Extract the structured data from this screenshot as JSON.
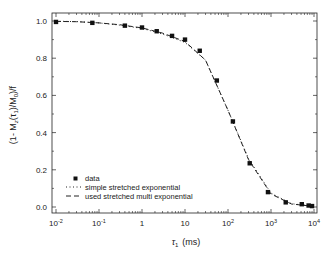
{
  "chart_data": {
    "type": "scatter",
    "title": "",
    "xlabel": "τ1 (ms)",
    "ylabel": "(1- Mz(τ1)/M0)/f",
    "xscale": "log",
    "xlim": [
      0.01,
      10000
    ],
    "ylim": [
      -0.03,
      1.05
    ],
    "x_ticks": [
      {
        "value": 0.01,
        "label": "10",
        "sup": "-2"
      },
      {
        "value": 0.1,
        "label": "10",
        "sup": "-1"
      },
      {
        "value": 1,
        "label": "1",
        "sup": ""
      },
      {
        "value": 10,
        "label": "10",
        "sup": ""
      },
      {
        "value": 100,
        "label": "10",
        "sup": "2"
      },
      {
        "value": 1000,
        "label": "10",
        "sup": "3"
      },
      {
        "value": 10000,
        "label": "10",
        "sup": "4"
      }
    ],
    "y_ticks": [
      {
        "value": 0.0,
        "label": "0.0"
      },
      {
        "value": 0.2,
        "label": "0.2"
      },
      {
        "value": 0.4,
        "label": "0.4"
      },
      {
        "value": 0.6,
        "label": "0.6"
      },
      {
        "value": 0.8,
        "label": "0.8"
      },
      {
        "value": 1.0,
        "label": "1.0"
      }
    ],
    "grid": false,
    "legend_position": "lower left",
    "series": [
      {
        "name": "data",
        "style": "square-marker",
        "x": [
          0.01,
          0.07,
          0.4,
          1,
          2.2,
          5,
          10,
          22,
          55,
          130,
          320,
          850,
          2200,
          5200,
          7500,
          9000
        ],
        "y": [
          0.995,
          0.99,
          0.975,
          0.965,
          0.945,
          0.92,
          0.9,
          0.84,
          0.68,
          0.46,
          0.235,
          0.08,
          0.025,
          0.015,
          0.008,
          0.005
        ]
      },
      {
        "name": "simple stretched exponential",
        "style": "dotted",
        "x": [
          0.01,
          0.03,
          0.1,
          0.3,
          1,
          3,
          10,
          30,
          100,
          300,
          1000,
          3000,
          10000
        ],
        "y": [
          0.999,
          0.997,
          0.99,
          0.978,
          0.96,
          0.93,
          0.885,
          0.79,
          0.52,
          0.26,
          0.075,
          0.018,
          0.003
        ]
      },
      {
        "name": "used stretched multi exponential",
        "style": "dashed",
        "x": [
          0.01,
          0.03,
          0.1,
          0.3,
          1,
          3,
          10,
          30,
          100,
          300,
          1000,
          3000,
          10000
        ],
        "y": [
          0.998,
          0.996,
          0.99,
          0.98,
          0.963,
          0.935,
          0.89,
          0.79,
          0.52,
          0.255,
          0.07,
          0.016,
          0.003
        ]
      }
    ]
  },
  "legend": {
    "items": [
      {
        "label": "data"
      },
      {
        "label": "simple stretched exponential"
      },
      {
        "label": "used stretched multi exponential"
      }
    ]
  },
  "axes": {
    "ylabel_main": "(1- M",
    "ylabel_sub_z": "z",
    "ylabel_mid": "(τ",
    "ylabel_sub_1": "1",
    "ylabel_mid2": ")/M",
    "ylabel_sub_0": "0",
    "ylabel_end": ")/f",
    "xlabel_tau": "τ",
    "xlabel_sub": "1",
    "xlabel_unit": "(ms)"
  }
}
